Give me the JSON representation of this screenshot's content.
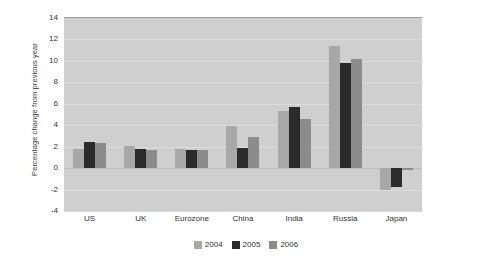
{
  "chart_data": {
    "type": "bar",
    "title": "",
    "xlabel": "",
    "ylabel": "Percentage change from previous year",
    "ylim": [
      -4,
      14
    ],
    "yticks": [
      14,
      12,
      10,
      8,
      6,
      4,
      2,
      0,
      -2,
      -4
    ],
    "grid": true,
    "legend_position": "bottom",
    "categories": [
      "US",
      "UK",
      "Eurozone",
      "China",
      "India",
      "Russia",
      "Japan"
    ],
    "series": [
      {
        "name": "2004",
        "color": "#a8a8a8",
        "values": [
          1.8,
          2.1,
          1.8,
          3.9,
          5.3,
          11.4,
          -2.0
        ]
      },
      {
        "name": "2005",
        "color": "#2b2b2b",
        "values": [
          2.4,
          1.8,
          1.7,
          1.9,
          5.7,
          9.8,
          -1.8
        ]
      },
      {
        "name": "2006",
        "color": "#8c8c8c",
        "values": [
          2.3,
          1.7,
          1.7,
          2.9,
          4.6,
          10.2,
          -0.2
        ]
      }
    ]
  },
  "legend": {
    "items": [
      {
        "label": "2004",
        "color": "#a8a8a8"
      },
      {
        "label": "2005",
        "color": "#2b2b2b"
      },
      {
        "label": "2006",
        "color": "#8c8c8c"
      }
    ]
  }
}
